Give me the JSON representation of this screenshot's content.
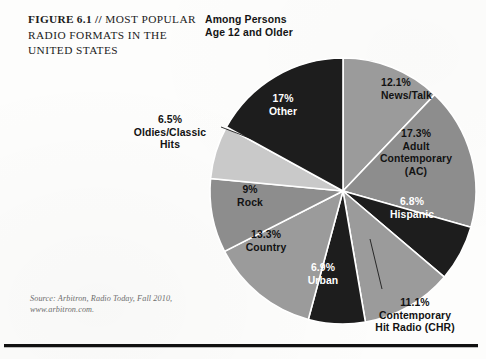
{
  "figure": {
    "title_prefix": "FIGURE 6.1 //",
    "title_rest": " MOST POPULAR RADIO FORMATS IN THE UNITED STATES",
    "subtitle": "Among Persons\nAge 12 and Older",
    "source": "Source: Arbitron, Radio Today, Fall 2010,\nwww.arbitron.com."
  },
  "chart_data": {
    "type": "pie",
    "title": "FIGURE 6.1 // MOST POPULAR RADIO FORMATS IN THE UNITED STATES",
    "subtitle": "Among Persons Age 12 and Older",
    "units": "percent",
    "start_angle_deg": 0,
    "direction": "clockwise",
    "legend": "none-inline-labels",
    "grid": false,
    "labels": [
      "News/Talk",
      "Adult Contemporary (AC)",
      "Hispanic",
      "Contemporary Hit Radio (CHR)",
      "Urban",
      "Country",
      "Rock",
      "Oldies/Classic Hits",
      "Other"
    ],
    "values": [
      12.1,
      17.3,
      6.8,
      11.1,
      6.9,
      13.3,
      9.0,
      6.5,
      17.0
    ],
    "slices": [
      {
        "label": "News/Talk",
        "value": 12.1,
        "display": "12.1%",
        "color": "#9b9b9b",
        "text_color": "#121212"
      },
      {
        "label": "Adult\nContemporary\n(AC)",
        "value": 17.3,
        "display": "17.3%",
        "color": "#8d8d8d",
        "text_color": "#121212"
      },
      {
        "label": "Hispanic",
        "value": 6.8,
        "display": "6.8%",
        "color": "#1d1d1d",
        "text_color": "#ffffff"
      },
      {
        "label": "Contemporary\nHit Radio (CHR)",
        "value": 11.1,
        "display": "11.1%",
        "color": "#9b9b9b",
        "text_color": "#121212"
      },
      {
        "label": "Urban",
        "value": 6.9,
        "display": "6.9%",
        "color": "#1d1d1d",
        "text_color": "#ffffff"
      },
      {
        "label": "Country",
        "value": 13.3,
        "display": "13.3%",
        "color": "#9b9b9b",
        "text_color": "#121212"
      },
      {
        "label": "Rock",
        "value": 9.0,
        "display": "9%",
        "color": "#8d8d8d",
        "text_color": "#121212"
      },
      {
        "label": "Oldies/Classic\nHits",
        "value": 6.5,
        "display": "6.5%",
        "color": "#c9c9c9",
        "text_color": "#121212"
      },
      {
        "label": "Other",
        "value": 17.0,
        "display": "17%",
        "color": "#1d1d1d",
        "text_color": "#ffffff"
      }
    ]
  },
  "annotations": {
    "news_talk": "12.1%\nNews/Talk",
    "adult_contemporary": "17.3%\nAdult\nContemporary\n(AC)",
    "hispanic": "6.8%\nHispanic",
    "chr": "11.1%\nContemporary\nHit Radio (CHR)",
    "urban": "6.9%\nUrban",
    "country": "13.3%\nCountry",
    "rock": "9%\nRock",
    "oldies": "6.5%\nOldies/Classic\nHits",
    "other": "17%\nOther"
  }
}
